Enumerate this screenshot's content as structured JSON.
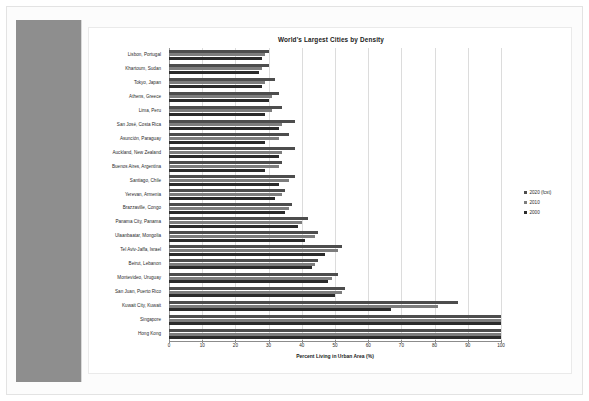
{
  "document": {
    "background_color": "#fcfcfc",
    "sheet_color": "#ffffff",
    "side_panel_color": "#8e8e8e"
  },
  "chart_data": {
    "type": "bar",
    "orientation": "horizontal",
    "title": "World's Largest Cities by Density",
    "xlabel": "Percent Living in Urban Area (%)",
    "ylabel": "",
    "xlim": [
      0,
      100
    ],
    "xticks": [
      0,
      10,
      20,
      30,
      40,
      50,
      60,
      70,
      80,
      90,
      100
    ],
    "grid": true,
    "legend_position": "right",
    "colors": {
      "2020 (fcst)": "#4d4d4d",
      "2010": "#7d7d7d",
      "2000": "#2b2b2b"
    },
    "categories": [
      "Lisbon, Portugal",
      "Khartoum, Sudan",
      "Tokyo, Japan",
      "Athens, Greece",
      "Lima, Peru",
      "San José, Costa Rica",
      "Asunción, Paraguay",
      "Auckland, New Zealand",
      "Buenos Aires, Argentina",
      "Santiago, Chile",
      "Yerevan, Armenia",
      "Brazzaville, Congo",
      "Panama City, Panama",
      "Ulaanbaatar, Mongolia",
      "Tel Aviv-Jaffa, Israel",
      "Beirut, Lebanon",
      "Montevideo, Uruguay",
      "San Juan, Puerto Rico",
      "Kuwait City, Kuwait",
      "Singapore",
      "Hong Kong"
    ],
    "series": [
      {
        "name": "2020 (fcst)",
        "values": [
          30,
          30,
          32,
          33,
          34,
          38,
          36,
          38,
          34,
          38,
          35,
          37,
          42,
          45,
          52,
          45,
          51,
          53,
          87,
          100,
          100
        ]
      },
      {
        "name": "2010",
        "values": [
          29,
          28,
          29,
          31,
          31,
          34,
          33,
          34,
          33,
          36,
          34,
          36,
          40,
          44,
          51,
          44,
          49,
          52,
          81,
          100,
          100
        ]
      },
      {
        "name": "2000",
        "values": [
          28,
          27,
          28,
          30,
          29,
          33,
          29,
          33,
          29,
          33,
          32,
          35,
          39,
          41,
          47,
          43,
          48,
          50,
          67,
          100,
          100
        ]
      }
    ],
    "legend": [
      "2020 (fcst)",
      "2010",
      "2000"
    ]
  }
}
